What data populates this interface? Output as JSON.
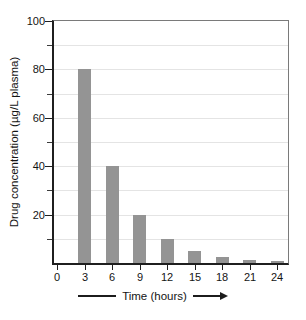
{
  "chart_data": {
    "type": "bar",
    "title": "",
    "xlabel": "Time (hours)",
    "ylabel": "Drug concentration (µg/L plasma)",
    "x": [
      3,
      6,
      9,
      12,
      15,
      18,
      21,
      24
    ],
    "values": [
      80,
      40,
      20,
      10,
      5,
      2.5,
      1.25,
      0.6
    ],
    "xlim": [
      0,
      24
    ],
    "ylim": [
      0,
      100
    ],
    "x_tick_labels": [
      "0",
      "3",
      "6",
      "9",
      "12",
      "15",
      "18",
      "21",
      "24"
    ],
    "x_tick_values": [
      0,
      3,
      6,
      9,
      12,
      15,
      18,
      21,
      24
    ],
    "y_ticks_major": [
      20,
      40,
      60,
      80,
      100
    ],
    "y_tick_labels_major": [
      "20",
      "40",
      "60",
      "80",
      "100"
    ],
    "y_ticks_minor": [
      10,
      30,
      50,
      70,
      90
    ],
    "gridlines": [
      10,
      20,
      30,
      40,
      50,
      60,
      70,
      80,
      90
    ],
    "grid": "on",
    "legend": "none",
    "bar_color": "#949494",
    "grid_color": "#e4e4e4",
    "axis_color": "#1f1f1f",
    "box_border_color": "#7a7a7a"
  }
}
